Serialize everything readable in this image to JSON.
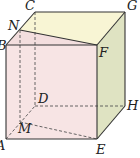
{
  "diagram": {
    "type": "geometry-cuboid",
    "colors": {
      "front_face": "#f7e4e4",
      "top_face": "#f8f5d4",
      "right_face": "#dfe3c2",
      "section": "#f3dede",
      "edge": "#333333",
      "hidden_edge": "#444444"
    },
    "vertices": {
      "A": {
        "label": "A",
        "x": 6,
        "y": 139
      },
      "B": {
        "label": "B",
        "x": 6,
        "y": 45
      },
      "C": {
        "label": "C",
        "x": 35,
        "y": 12
      },
      "D": {
        "label": "D",
        "x": 35,
        "y": 106
      },
      "E": {
        "label": "E",
        "x": 97,
        "y": 139
      },
      "F": {
        "label": "F",
        "x": 97,
        "y": 45
      },
      "G": {
        "label": "G",
        "x": 125,
        "y": 12
      },
      "H": {
        "label": "H",
        "x": 125,
        "y": 106
      },
      "M": {
        "label": "M",
        "x": 20,
        "y": 122
      },
      "N": {
        "label": "N",
        "x": 20,
        "y": 30
      }
    }
  }
}
